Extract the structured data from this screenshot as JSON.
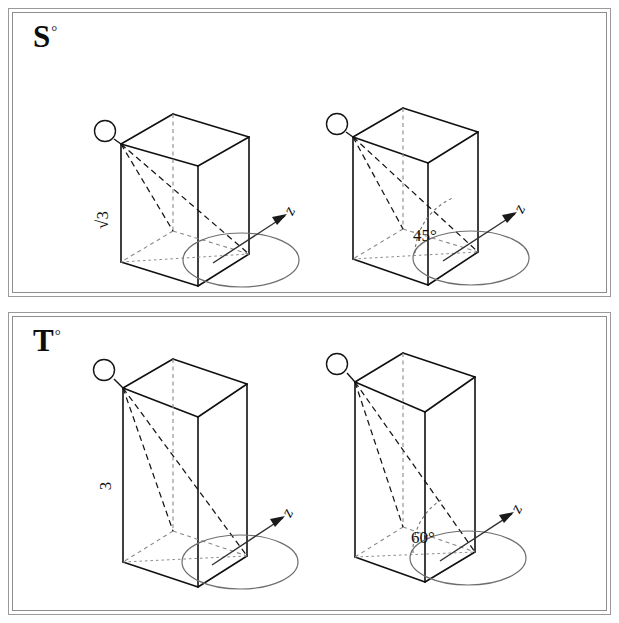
{
  "page": {
    "width": 619,
    "height": 623,
    "background": "#ffffff",
    "line_color": "#101010",
    "hidden_line_color": "#7a7a7a",
    "ellipse_color": "#6e6e6e",
    "frame_color": "#9a9a9a"
  },
  "panels": [
    {
      "id": "S",
      "label_letter": "S",
      "label_degree": "°",
      "figures": [
        {
          "id": "s-left",
          "name": "box-with-edge-label",
          "edge_label": "√3",
          "axis_label": "z",
          "marker": "vertex-callout-circle",
          "base_ellipse": true,
          "diagonals": 2,
          "box_shape": "short-rectangular-prism"
        },
        {
          "id": "s-right",
          "name": "box-with-angle-label",
          "angle_label": "45°",
          "angle_value": 45,
          "axis_label": "z",
          "marker": "vertex-callout-circle",
          "base_ellipse": true,
          "diagonals": 2,
          "box_shape": "short-rectangular-prism"
        }
      ]
    },
    {
      "id": "T",
      "label_letter": "T",
      "label_degree": "°",
      "figures": [
        {
          "id": "t-left",
          "name": "box-with-edge-label",
          "edge_label": "3",
          "axis_label": "z",
          "marker": "vertex-callout-circle",
          "base_ellipse": true,
          "diagonals": 2,
          "box_shape": "tall-rectangular-prism"
        },
        {
          "id": "t-right",
          "name": "box-with-angle-label",
          "angle_label": "60°",
          "angle_value": 60,
          "axis_label": "z",
          "marker": "vertex-callout-circle",
          "base_ellipse": true,
          "diagonals": 2,
          "box_shape": "tall-rectangular-prism"
        }
      ]
    }
  ]
}
